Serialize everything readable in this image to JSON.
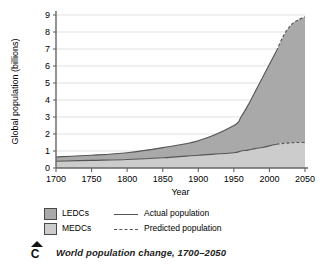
{
  "figure": {
    "caption_marker": "C",
    "caption_text": "World population change, 1700–2050"
  },
  "legend": {
    "items": [
      {
        "key": "ledcs-swatch",
        "label": "LEDCs"
      },
      {
        "key": "medcs-swatch",
        "label": "MEDCs"
      }
    ],
    "lines": [
      {
        "key": "actual-line",
        "label": "Actual population",
        "style": "solid"
      },
      {
        "key": "predicted-line",
        "label": "Predicted population",
        "style": "dashed"
      }
    ]
  },
  "colors": {
    "ledc_fill": "#a9a9a9",
    "medc_fill": "#cccccc",
    "line": "#555555",
    "axis": "#666666",
    "grid": "#d9d9d9",
    "text": "#000000"
  },
  "chart_data": {
    "type": "area",
    "title": "World population change, 1700–2050",
    "xlabel": "Year",
    "ylabel": "Global population (billions)",
    "xlim": [
      1700,
      2050
    ],
    "ylim": [
      0,
      9
    ],
    "xticks": [
      1700,
      1750,
      1800,
      1850,
      1900,
      1950,
      2000,
      2050
    ],
    "yticks": [
      0,
      1,
      2,
      3,
      4,
      5,
      6,
      7,
      8,
      9
    ],
    "grid": true,
    "legend_position": "below",
    "prediction_starts": 2010,
    "x": [
      1700,
      1750,
      1800,
      1850,
      1900,
      1950,
      1960,
      1970,
      1980,
      1990,
      2000,
      2010,
      2020,
      2030,
      2040,
      2050
    ],
    "series": [
      {
        "name": "MEDCs",
        "fill": "#cccccc",
        "values": [
          0.4,
          0.45,
          0.5,
          0.6,
          0.75,
          0.9,
          1.0,
          1.05,
          1.14,
          1.21,
          1.3,
          1.4,
          1.45,
          1.48,
          1.5,
          1.5
        ]
      },
      {
        "name": "LEDCs",
        "fill": "#a9a9a9",
        "values": [
          0.25,
          0.3,
          0.4,
          0.6,
          0.85,
          1.6,
          2.0,
          2.65,
          3.36,
          4.09,
          4.8,
          5.5,
          6.35,
          7.2,
          8.0,
          7.4
        ]
      }
    ],
    "total": {
      "name": "Total global population",
      "values": [
        0.65,
        0.75,
        0.9,
        1.2,
        1.6,
        2.5,
        3.0,
        3.7,
        4.5,
        5.3,
        6.1,
        6.9,
        7.8,
        8.4,
        8.7,
        8.9
      ]
    },
    "annotations": []
  }
}
